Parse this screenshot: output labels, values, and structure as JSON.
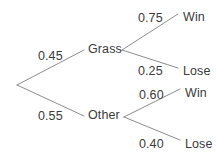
{
  "diagram": {
    "type": "probability-tree",
    "title": "",
    "stroke_color": "#808080",
    "text_color": "#3b3b3b",
    "background_color": "#ffffff",
    "root": {
      "x": 17,
      "y": 85
    },
    "level1": [
      {
        "id": "grass",
        "label": "Grass",
        "probability": "0.45",
        "label_x": 88,
        "label_y": 43,
        "prob_x": 38,
        "prob_y": 50,
        "node_x": 122,
        "node_y": 50
      },
      {
        "id": "other",
        "label": "Other",
        "probability": "0.55",
        "label_x": 88,
        "label_y": 109,
        "prob_x": 38,
        "prob_y": 110,
        "node_x": 124,
        "node_y": 117
      }
    ],
    "level2": [
      {
        "id": "grass-win",
        "parent": "grass",
        "label": "Win",
        "probability": "0.75",
        "label_x": 183,
        "label_y": 11,
        "prob_x": 138,
        "prob_y": 12,
        "end_x": 178,
        "end_y": 14
      },
      {
        "id": "grass-lose",
        "parent": "grass",
        "label": "Lose",
        "probability": "0.25",
        "label_x": 183,
        "label_y": 64,
        "prob_x": 138,
        "prob_y": 64,
        "end_x": 178,
        "end_y": 68
      },
      {
        "id": "other-win",
        "parent": "other",
        "label": "Win",
        "probability": "0.60",
        "label_x": 185,
        "label_y": 86,
        "prob_x": 139,
        "prob_y": 88,
        "end_x": 180,
        "end_y": 89
      },
      {
        "id": "other-lose",
        "parent": "other",
        "label": "Lose",
        "probability": "0.40",
        "label_x": 185,
        "label_y": 137,
        "prob_x": 139,
        "prob_y": 137,
        "end_x": 180,
        "end_y": 140
      }
    ]
  }
}
